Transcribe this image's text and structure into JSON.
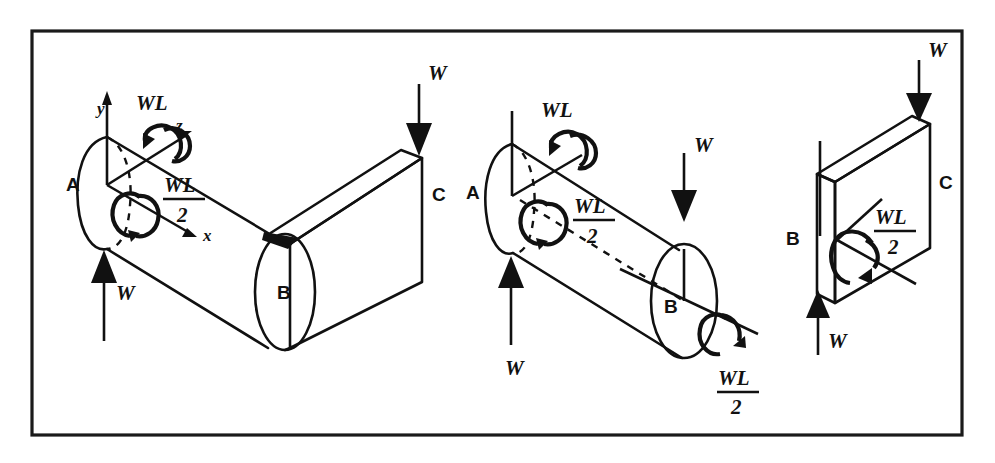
{
  "figure": {
    "kind": "engineering-free-body-diagram",
    "border_color": "#1a1a1a",
    "line_color": "#111111",
    "background_color": "#ffffff"
  },
  "panels": [
    {
      "id": "panel-1",
      "name": "bent-bar-full-assembly",
      "axes": {
        "x_label": "x",
        "y_label": "y",
        "z_label": "z"
      },
      "points": [
        {
          "name": "point-a",
          "label": "A"
        },
        {
          "name": "point-b",
          "label": "B"
        },
        {
          "name": "point-c",
          "label": "C"
        }
      ],
      "forces": [
        {
          "name": "force-w-at-a",
          "label": "W",
          "direction": "up"
        },
        {
          "name": "force-w-at-c",
          "label": "W",
          "direction": "down"
        }
      ],
      "moments": [
        {
          "name": "moment-wl-about-z",
          "numerator": "WL",
          "denominator": "",
          "label": "WL"
        },
        {
          "name": "moment-wl-over-2-about-x",
          "numerator": "WL",
          "denominator": "2",
          "label": "WL/2"
        }
      ]
    },
    {
      "id": "panel-2",
      "name": "segment-ab-free-body",
      "points": [
        {
          "name": "point-a",
          "label": "A"
        },
        {
          "name": "point-b",
          "label": "B"
        }
      ],
      "forces": [
        {
          "name": "force-w-at-a",
          "label": "W",
          "direction": "up"
        },
        {
          "name": "force-w-at-b",
          "label": "W",
          "direction": "down"
        }
      ],
      "moments": [
        {
          "name": "moment-wl-at-a",
          "numerator": "WL",
          "denominator": "",
          "label": "WL"
        },
        {
          "name": "moment-wl-over-2-at-a",
          "numerator": "WL",
          "denominator": "2",
          "label": "WL/2"
        },
        {
          "name": "moment-wl-over-2-at-b",
          "numerator": "WL",
          "denominator": "2",
          "label": "WL/2"
        }
      ]
    },
    {
      "id": "panel-3",
      "name": "segment-bc-free-body",
      "points": [
        {
          "name": "point-b",
          "label": "B"
        },
        {
          "name": "point-c",
          "label": "C"
        }
      ],
      "forces": [
        {
          "name": "force-w-at-b",
          "label": "W",
          "direction": "up"
        },
        {
          "name": "force-w-at-c",
          "label": "W",
          "direction": "down"
        }
      ],
      "moments": [
        {
          "name": "moment-wl-over-2-at-b",
          "numerator": "WL",
          "denominator": "2",
          "label": "WL/2"
        }
      ]
    }
  ],
  "labels": {
    "A": "A",
    "B": "B",
    "C": "C",
    "W": "W",
    "WL": "WL",
    "two": "2",
    "x": "x",
    "y": "y",
    "z": "z"
  }
}
